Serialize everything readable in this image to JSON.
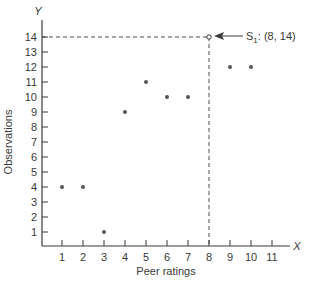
{
  "chart_data": {
    "type": "scatter",
    "title": "",
    "xlabel": "Peer ratings",
    "ylabel": "Observations",
    "x_axis_letter": "X",
    "y_axis_letter": "Y",
    "xlim": [
      0,
      12
    ],
    "ylim": [
      0,
      14.8
    ],
    "x_ticks": [
      1,
      2,
      3,
      4,
      5,
      6,
      7,
      8,
      9,
      10,
      11
    ],
    "y_ticks": [
      1,
      2,
      3,
      4,
      5,
      6,
      7,
      8,
      9,
      10,
      11,
      12,
      13,
      14
    ],
    "grid": false,
    "legend": null,
    "points": [
      {
        "x": 1,
        "y": 4
      },
      {
        "x": 2,
        "y": 4
      },
      {
        "x": 3,
        "y": 1
      },
      {
        "x": 4,
        "y": 9
      },
      {
        "x": 5,
        "y": 11
      },
      {
        "x": 6,
        "y": 10
      },
      {
        "x": 7,
        "y": 10
      },
      {
        "x": 9,
        "y": 12
      },
      {
        "x": 10,
        "y": 12
      }
    ],
    "highlighted_point": {
      "x": 8,
      "y": 14,
      "label": "S",
      "subscript": "1",
      "text": ": (8, 14)",
      "style": "open-circle",
      "guides": "dashed"
    },
    "annotations": [
      {
        "text": "S1: (8, 14)",
        "points_to": {
          "x": 8,
          "y": 14
        },
        "arrow": true
      }
    ]
  },
  "colors": {
    "ink": "#3a3a3a",
    "point": "#555555",
    "background": "#ffffff"
  }
}
